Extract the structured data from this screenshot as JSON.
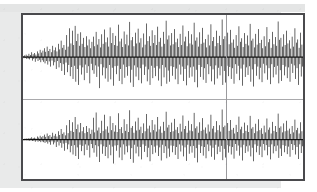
{
  "figure": {
    "title": "",
    "frame": {
      "border_color": "#4a4a4d",
      "background_color": "#ffffff",
      "page_background_color": "#e9eaea"
    },
    "cursor": {
      "label": "",
      "color": "#9a9a9d",
      "position_fraction": 0.715
    },
    "divider": {
      "color": "#a9a9ac"
    }
  },
  "chart_data": {
    "type": "line",
    "title": "",
    "subtitle": "",
    "xlabel": "",
    "ylabel": "",
    "xlim": [
      0,
      1
    ],
    "ylim": [
      -1,
      1
    ],
    "grid": false,
    "legend_position": "none",
    "annotations": [
      {
        "name": "time-cursor",
        "x": 0.715,
        "text": ""
      }
    ],
    "panels": [
      {
        "name": "channel-1",
        "label": "",
        "baseline": 0,
        "waveform_color": "#111111",
        "samples": [
          0.02,
          -0.03,
          0.04,
          -0.02,
          0.06,
          -0.05,
          0.03,
          -0.04,
          0.08,
          -0.06,
          0.05,
          -0.03,
          0.12,
          -0.09,
          0.07,
          -0.05,
          0.1,
          -0.12,
          0.06,
          -0.04,
          0.14,
          -0.1,
          0.09,
          -0.07,
          0.18,
          -0.13,
          0.11,
          -0.08,
          0.16,
          -0.12,
          0.22,
          -0.16,
          0.13,
          -0.1,
          0.26,
          -0.19,
          0.15,
          -0.11,
          0.2,
          -0.24,
          0.12,
          -0.09,
          0.28,
          -0.21,
          0.17,
          -0.13,
          0.24,
          -0.3,
          0.14,
          -0.1,
          0.33,
          -0.26,
          0.19,
          -0.15,
          0.41,
          -0.35,
          0.23,
          -0.18,
          0.3,
          -0.45,
          0.18,
          -0.14,
          0.55,
          -0.38,
          0.26,
          -0.2,
          0.72,
          -0.48,
          0.34,
          -0.25,
          0.66,
          -0.55,
          0.3,
          -0.22,
          0.78,
          -0.62,
          0.4,
          -0.3,
          0.58,
          -0.7,
          0.28,
          -0.21,
          0.62,
          -0.44,
          0.33,
          -0.26,
          0.48,
          -0.58,
          0.25,
          -0.19,
          0.52,
          -0.4,
          0.29,
          -0.23,
          0.44,
          -0.66,
          0.22,
          -0.17,
          0.38,
          -0.33,
          0.51,
          -0.42,
          0.27,
          -0.21,
          0.63,
          -0.5,
          0.31,
          -0.24,
          0.45,
          -0.78,
          0.24,
          -0.18,
          0.57,
          -0.46,
          0.33,
          -0.26,
          0.69,
          -0.54,
          0.37,
          -0.28,
          0.49,
          -0.62,
          0.26,
          -0.2,
          0.74,
          -0.56,
          0.35,
          -0.27,
          0.6,
          -0.72,
          0.3,
          -0.23,
          0.53,
          -0.43,
          0.28,
          -0.22,
          0.81,
          -0.6,
          0.39,
          -0.3,
          0.46,
          -0.68,
          0.25,
          -0.19,
          0.64,
          -0.52,
          0.32,
          -0.25,
          0.56,
          -0.47,
          0.29,
          -0.23,
          0.88,
          -0.64,
          0.42,
          -0.32,
          0.5,
          -0.75,
          0.27,
          -0.21,
          0.61,
          -0.49,
          0.34,
          -0.26,
          0.71,
          -0.58,
          0.36,
          -0.28,
          0.47,
          -0.66,
          0.24,
          -0.19,
          0.59,
          -0.45,
          0.31,
          -0.24,
          0.84,
          -0.61,
          0.4,
          -0.31,
          0.52,
          -0.7,
          0.28,
          -0.22,
          0.67,
          -0.53,
          0.35,
          -0.27,
          0.55,
          -0.48,
          0.3,
          -0.23,
          0.76,
          -0.59,
          0.38,
          -0.29,
          0.48,
          -0.73,
          0.26,
          -0.2,
          0.63,
          -0.51,
          0.33,
          -0.26,
          0.91,
          -0.67,
          0.44,
          -0.34,
          0.54,
          -0.62,
          0.29,
          -0.23,
          0.6,
          -0.47,
          0.32,
          -0.25,
          0.7,
          -0.56,
          0.37,
          -0.29,
          0.46,
          -0.68,
          0.25,
          -0.19,
          0.58,
          -0.44,
          0.3,
          -0.24,
          0.79,
          -0.6,
          0.39,
          -0.3,
          0.51,
          -0.71,
          0.27,
          -0.21,
          0.65,
          -0.52,
          0.34,
          -0.26,
          0.57,
          -0.49,
          0.31,
          -0.24,
          0.86,
          -0.63,
          0.41,
          -0.32,
          0.49,
          -0.76,
          0.26,
          -0.2,
          0.62,
          -0.5,
          0.33,
          -0.25,
          0.73,
          -0.57,
          0.36,
          -0.28,
          0.45,
          -0.65,
          0.24,
          -0.18,
          0.56,
          -0.43,
          0.29,
          -0.23,
          0.82,
          -0.61,
          0.4,
          -0.31,
          0.5,
          -0.69,
          0.27,
          -0.21,
          0.66,
          -0.54,
          0.35,
          -0.27,
          0.53,
          -0.46,
          0.3,
          -0.23,
          0.94,
          -0.7,
          0.45,
          -0.35,
          0.52,
          -0.64,
          0.28,
          -0.22,
          0.61,
          -0.48,
          0.32,
          -0.25,
          0.68,
          -0.55,
          0.36,
          -0.28,
          0.44,
          -0.67,
          0.23,
          -0.18,
          0.55,
          -0.42,
          0.28,
          -0.22,
          0.77,
          -0.58,
          0.38,
          -0.29,
          0.47,
          -0.72,
          0.25,
          -0.19,
          0.6,
          -0.5,
          0.33,
          -0.26,
          0.54,
          -0.45,
          0.29,
          -0.23,
          0.83,
          -0.62,
          0.41,
          -0.31,
          0.46,
          -0.74,
          0.24,
          -0.18,
          0.58,
          -0.47,
          0.31,
          -0.24,
          0.7,
          -0.56,
          0.35,
          -0.27,
          0.43,
          -0.63,
          0.22,
          -0.17,
          0.52,
          -0.41,
          0.27,
          -0.21,
          0.75,
          -0.57,
          0.37,
          -0.28,
          0.45,
          -0.68,
          0.23,
          -0.18,
          0.63,
          -0.51,
          0.32,
          -0.25,
          0.5,
          -0.44,
          0.28,
          -0.22,
          0.89,
          -0.66,
          0.43,
          -0.33,
          0.48,
          -0.6,
          0.26,
          -0.2,
          0.57,
          -0.46,
          0.3,
          -0.24,
          0.66,
          -0.53,
          0.34,
          -0.26,
          0.42,
          -0.62,
          0.21,
          -0.17,
          0.51,
          -0.4,
          0.26,
          -0.21,
          0.72,
          -0.55,
          0.36,
          -0.28,
          0.44,
          -0.7,
          0.23,
          -0.18,
          0.61,
          -0.49,
          0.31,
          -0.24
        ]
      },
      {
        "name": "channel-2",
        "label": "",
        "baseline": 0,
        "waveform_color": "#111111",
        "samples": [
          0.01,
          -0.02,
          0.02,
          -0.01,
          0.03,
          -0.02,
          0.02,
          -0.02,
          0.04,
          -0.03,
          0.03,
          -0.02,
          0.06,
          -0.04,
          0.04,
          -0.03,
          0.05,
          -0.06,
          0.03,
          -0.02,
          0.08,
          -0.06,
          0.05,
          -0.04,
          0.1,
          -0.07,
          0.06,
          -0.05,
          0.09,
          -0.07,
          0.13,
          -0.09,
          0.07,
          -0.06,
          0.16,
          -0.11,
          0.09,
          -0.07,
          0.12,
          -0.14,
          0.07,
          -0.05,
          0.18,
          -0.13,
          0.1,
          -0.08,
          0.15,
          -0.2,
          0.08,
          -0.06,
          0.22,
          -0.16,
          0.12,
          -0.09,
          0.28,
          -0.22,
          0.15,
          -0.11,
          0.19,
          -0.3,
          0.11,
          -0.09,
          0.38,
          -0.26,
          0.17,
          -0.13,
          0.52,
          -0.34,
          0.23,
          -0.17,
          0.46,
          -0.4,
          0.2,
          -0.15,
          0.6,
          -0.44,
          0.28,
          -0.21,
          0.4,
          -0.52,
          0.19,
          -0.14,
          0.44,
          -0.31,
          0.22,
          -0.17,
          0.33,
          -0.42,
          0.17,
          -0.13,
          0.36,
          -0.28,
          0.2,
          -0.16,
          0.3,
          -0.48,
          0.15,
          -0.12,
          0.26,
          -0.23,
          0.58,
          -0.35,
          0.19,
          -0.15,
          0.72,
          -0.46,
          0.24,
          -0.18,
          0.32,
          -0.6,
          0.17,
          -0.13,
          0.5,
          -0.38,
          0.23,
          -0.18,
          0.66,
          -0.44,
          0.27,
          -0.2,
          0.35,
          -0.5,
          0.18,
          -0.14,
          0.62,
          -0.42,
          0.25,
          -0.19,
          0.44,
          -0.64,
          0.21,
          -0.16,
          0.38,
          -0.3,
          0.2,
          -0.15,
          0.7,
          -0.48,
          0.28,
          -0.21,
          0.33,
          -0.55,
          0.17,
          -0.13,
          0.54,
          -0.4,
          0.23,
          -0.18,
          0.41,
          -0.34,
          0.2,
          -0.16,
          0.78,
          -0.52,
          0.31,
          -0.23,
          0.36,
          -0.62,
          0.18,
          -0.14,
          0.48,
          -0.37,
          0.24,
          -0.19,
          0.58,
          -0.45,
          0.26,
          -0.2,
          0.34,
          -0.53,
          0.17,
          -0.13,
          0.43,
          -0.33,
          0.22,
          -0.17,
          0.68,
          -0.47,
          0.29,
          -0.22,
          0.37,
          -0.58,
          0.19,
          -0.15,
          0.52,
          -0.39,
          0.25,
          -0.19,
          0.4,
          -0.35,
          0.21,
          -0.16,
          0.6,
          -0.44,
          0.27,
          -0.21,
          0.35,
          -0.56,
          0.18,
          -0.14,
          0.47,
          -0.36,
          0.23,
          -0.18,
          0.74,
          -0.5,
          0.32,
          -0.24,
          0.39,
          -0.46,
          0.2,
          -0.16,
          0.45,
          -0.34,
          0.22,
          -0.17,
          0.55,
          -0.41,
          0.26,
          -0.2,
          0.33,
          -0.52,
          0.17,
          -0.13,
          0.42,
          -0.32,
          0.21,
          -0.16,
          0.64,
          -0.45,
          0.28,
          -0.21,
          0.36,
          -0.57,
          0.18,
          -0.14,
          0.5,
          -0.38,
          0.24,
          -0.18,
          0.41,
          -0.35,
          0.22,
          -0.17,
          0.71,
          -0.49,
          0.3,
          -0.23,
          0.35,
          -0.61,
          0.18,
          -0.14,
          0.46,
          -0.36,
          0.23,
          -0.18,
          0.57,
          -0.43,
          0.26,
          -0.2,
          0.32,
          -0.5,
          0.16,
          -0.13,
          0.4,
          -0.31,
          0.21,
          -0.16,
          0.66,
          -0.46,
          0.29,
          -0.22,
          0.36,
          -0.54,
          0.19,
          -0.14,
          0.49,
          -0.39,
          0.25,
          -0.19,
          0.38,
          -0.33,
          0.21,
          -0.17,
          0.8,
          -0.55,
          0.33,
          -0.25,
          0.37,
          -0.48,
          0.2,
          -0.15,
          0.44,
          -0.35,
          0.23,
          -0.18,
          0.52,
          -0.4,
          0.26,
          -0.2,
          0.31,
          -0.51,
          0.16,
          -0.12,
          0.39,
          -0.3,
          0.2,
          -0.16,
          0.61,
          -0.43,
          0.27,
          -0.21,
          0.34,
          -0.56,
          0.17,
          -0.14,
          0.45,
          -0.36,
          0.23,
          -0.18,
          0.38,
          -0.32,
          0.2,
          -0.16,
          0.63,
          -0.45,
          0.29,
          -0.22,
          0.33,
          -0.58,
          0.17,
          -0.13,
          0.42,
          -0.34,
          0.22,
          -0.17,
          0.54,
          -0.41,
          0.25,
          -0.19,
          0.3,
          -0.47,
          0.15,
          -0.12,
          0.37,
          -0.29,
          0.19,
          -0.15,
          0.56,
          -0.42,
          0.26,
          -0.2,
          0.32,
          -0.53,
          0.16,
          -0.13,
          0.47,
          -0.37,
          0.23,
          -0.18,
          0.36,
          -0.31,
          0.2,
          -0.16,
          0.69,
          -0.49,
          0.31,
          -0.24,
          0.35,
          -0.44,
          0.19,
          -0.15,
          0.43,
          -0.34,
          0.22,
          -0.17,
          0.5,
          -0.39,
          0.24,
          -0.19,
          0.29,
          -0.46,
          0.15,
          -0.12,
          0.36,
          -0.28,
          0.19,
          -0.15,
          0.53,
          -0.4,
          0.25,
          -0.2,
          0.31,
          -0.52,
          0.16,
          -0.13,
          0.46,
          -0.36,
          0.22,
          -0.18
        ]
      }
    ]
  }
}
